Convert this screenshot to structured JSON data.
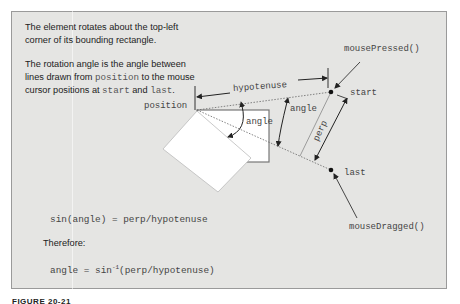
{
  "description": {
    "line1": "The element rotates about the top-left",
    "line2": "corner of its bounding rectangle.",
    "para2_a": "The rotation angle is the angle between",
    "para2_b": "lines drawn from ",
    "para2_code_position": "position",
    "para2_c": " to the mouse",
    "para2_d": "cursor positions at ",
    "para2_code_start": "start",
    "para2_e": " and ",
    "para2_code_last": "last",
    "para2_f": "."
  },
  "labels": {
    "position": "position",
    "hypotenuse": "hypotenuse",
    "start": "start",
    "last": "last",
    "angle_inner": "angle",
    "angle_outer": "angle",
    "perp": "perp",
    "mouse_pressed": "mousePressed()",
    "mouse_dragged": "mouseDragged()"
  },
  "formulas": {
    "sin_equation": "sin(angle) = perp/hypotenuse",
    "therefore": "Therefore:",
    "angle_prefix": "angle = sin",
    "angle_sup": "-1",
    "angle_suffix": "(perp/hypotenuse)"
  },
  "caption": "FIGURE 20-21",
  "colors": {
    "panel_bg": "#e5e5e3",
    "panel_border": "#9a9a9a",
    "line": "#333333",
    "text": "#222222",
    "code": "#555555"
  }
}
